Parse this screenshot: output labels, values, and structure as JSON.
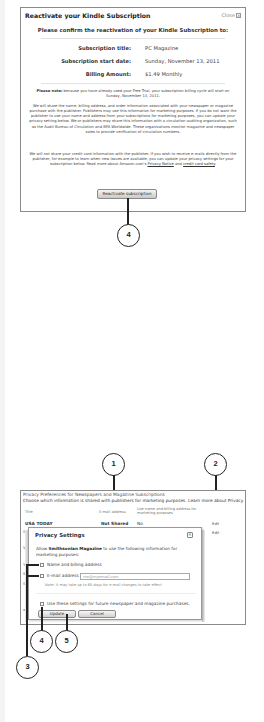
{
  "reactivate_dialog": {
    "title": "Reactivate your Kindle Subscription",
    "close_label": "Close",
    "close_icon": "x-box-icon",
    "confirm_heading": "Please confirm the reactivation of your Kindle Subscription to:",
    "fields": [
      {
        "label": "Subscription title:",
        "value": "PC Magazine"
      },
      {
        "label": "Subscription start date:",
        "value": "Sunday, November 13, 2011"
      },
      {
        "label": "Billing Amount:",
        "value": "$1.49 Monthly"
      }
    ],
    "note_bold": "Please note:",
    "note_text": " because you have already used your Free Trial, your subscription billing cycle will start on Sunday, November 13, 2011.",
    "paragraph1": "We will share the name, billing address, and order information associated with your newspaper or magazine purchase with the publisher. Publishers may use this information for marketing purposes. If you do not want the publisher to use your name and address from your subscriptions for marketing purposes, you can update your privacy setting below. We or publishers may share this information with a circulation-auditing organization, such as the Audit Bureau of Circulation and BPA Worldwide. These organizations monitor magazine and newspaper sales to provide verification of circulation numbers.",
    "paragraph2_text": "We will not share your credit card information with the publisher. If you wish to receive e-mails directly from the publisher, for example to learn when new issues are available, you can update your privacy settings for your subscription below. Read more about Amazon.com's ",
    "privacy_notice_link": "Privacy Notice",
    "and_text": " and ",
    "credit_card_safety_link": "credit card safety",
    "period": ".",
    "button_label": "Reactivate subscription"
  },
  "callouts": {
    "c1": "1",
    "c2": "2",
    "c3": "3",
    "c4_top": "4",
    "c4_bottom": "4",
    "c5": "5"
  },
  "privacy_prefs": {
    "title": "Privacy Preferences for Newspapers and Magazine Subscriptions",
    "description": "Choose which information is shared with publishers for marketing purposes. Learn more about Privacy",
    "columns": {
      "title": "Title",
      "email": "E-mail address",
      "name_billing": "Use name and billing address for marketing purposes"
    },
    "rows": [
      {
        "title": "USA TODAY",
        "email": "Not Shared",
        "name_billing": "No",
        "action": "Edit"
      },
      {
        "title": "Sm",
        "action": "Edit"
      },
      {
        "title": "Vibe"
      },
      {
        "title": "You"
      },
      {
        "title": "Wo"
      },
      {
        "title": "Sta"
      },
      {
        "title": "wi"
      }
    ]
  },
  "privacy_settings_popup": {
    "title": "Privacy Settings",
    "close_icon": "x-box-icon",
    "allow_prefix": "Allow ",
    "allow_publication": "Smithsonian Magazine",
    "allow_suffix": " to use the following information for marketing purposes:",
    "option_name_billing": "Name and billing address",
    "option_email_label": "E-mail address",
    "email_value": "me@myemail.com",
    "email_note": "Note: it may take up to 60 days for e-mail changes to take effect",
    "future_option": "Use these settings for future newspaper and magazine purchases.",
    "update_label": "Update",
    "cancel_label": "Cancel"
  }
}
